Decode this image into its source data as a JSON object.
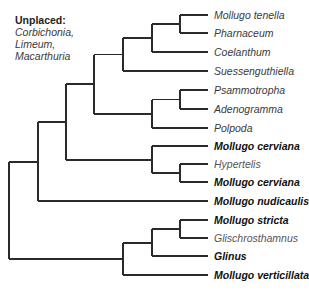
{
  "figure": {
    "type": "phylogenetic-tree",
    "orientation": "left-to-right",
    "branch_color": "#2a2a2a"
  },
  "unplaced": {
    "heading": "Unplaced:",
    "taxa": [
      "Corbichonia,",
      "Limeum,",
      "Macarthuria"
    ]
  },
  "leaves": [
    {
      "label": "Mollugo tenella",
      "bold": false,
      "y": 15
    },
    {
      "label": "Pharnaceum",
      "bold": false,
      "y": 33
    },
    {
      "label": "Coelanthum",
      "bold": false,
      "y": 52
    },
    {
      "label": "Suessenguthiella",
      "bold": false,
      "y": 71
    },
    {
      "label": "Psammotropha",
      "bold": false,
      "y": 90
    },
    {
      "label": "Adenogramma",
      "bold": false,
      "y": 109
    },
    {
      "label": "Polpoda",
      "bold": false,
      "y": 128
    },
    {
      "label": "Mollugo cerviana",
      "bold": true,
      "y": 146
    },
    {
      "label": "Hypertelis",
      "bold": false,
      "y": 164
    },
    {
      "label": "Mollugo cerviana",
      "bold": true,
      "y": 182
    },
    {
      "label": "Mollugo nudicaulis",
      "bold": true,
      "y": 201
    },
    {
      "label": "Mollugo stricta",
      "bold": true,
      "y": 220
    },
    {
      "label": "Glischrosthamnus",
      "bold": false,
      "y": 238
    },
    {
      "label": "Glinus",
      "bold": true,
      "y": 256
    },
    {
      "label": "Mollugo verticillata",
      "bold": true,
      "y": 275
    }
  ],
  "tree": {
    "leaf_x": 208,
    "nodes": [
      {
        "id": "root",
        "x": 9,
        "children_y": [
          162,
          259
        ]
      },
      {
        "id": "A",
        "x": 38,
        "children_y": [
          122,
          201
        ]
      },
      {
        "id": "B",
        "x": 66,
        "children_y": [
          84,
          160
        ]
      },
      {
        "id": "C",
        "x": 94,
        "children_y": [
          54.5,
          114
        ]
      },
      {
        "id": "D",
        "x": 123,
        "children_y": [
          38,
          71
        ]
      },
      {
        "id": "E",
        "x": 152,
        "children_y": [
          24,
          52
        ]
      },
      {
        "id": "F",
        "x": 180,
        "children_y": [
          15,
          33
        ]
      },
      {
        "id": "P",
        "x": 152,
        "children_y": [
          99.5,
          128
        ]
      },
      {
        "id": "Q",
        "x": 180,
        "children_y": [
          90,
          109
        ]
      },
      {
        "id": "M",
        "x": 152,
        "children_y": [
          146,
          173
        ]
      },
      {
        "id": "N",
        "x": 180,
        "children_y": [
          164,
          182
        ]
      },
      {
        "id": "L",
        "x": 123,
        "children_y": [
          243,
          275
        ]
      },
      {
        "id": "R",
        "x": 152,
        "children_y": [
          229,
          256
        ]
      },
      {
        "id": "S",
        "x": 180,
        "children_y": [
          220,
          238
        ]
      }
    ],
    "edges": [
      {
        "from_x": 9,
        "to_x": 38,
        "y": 162
      },
      {
        "from_x": 9,
        "to_x": 123,
        "y": 259
      },
      {
        "from_x": 38,
        "to_x": 66,
        "y": 122
      },
      {
        "from_x": 38,
        "to_x": 208,
        "y": 201
      },
      {
        "from_x": 66,
        "to_x": 94,
        "y": 84
      },
      {
        "from_x": 66,
        "to_x": 152,
        "y": 160
      },
      {
        "from_x": 94,
        "to_x": 123,
        "y": 54.5
      },
      {
        "from_x": 94,
        "to_x": 152,
        "y": 114
      },
      {
        "from_x": 123,
        "to_x": 152,
        "y": 38
      },
      {
        "from_x": 123,
        "to_x": 208,
        "y": 71
      },
      {
        "from_x": 152,
        "to_x": 180,
        "y": 24
      },
      {
        "from_x": 152,
        "to_x": 208,
        "y": 52
      },
      {
        "from_x": 180,
        "to_x": 208,
        "y": 15
      },
      {
        "from_x": 180,
        "to_x": 208,
        "y": 33
      },
      {
        "from_x": 152,
        "to_x": 180,
        "y": 99.5
      },
      {
        "from_x": 152,
        "to_x": 208,
        "y": 128
      },
      {
        "from_x": 180,
        "to_x": 208,
        "y": 90
      },
      {
        "from_x": 180,
        "to_x": 208,
        "y": 109
      },
      {
        "from_x": 152,
        "to_x": 208,
        "y": 146
      },
      {
        "from_x": 152,
        "to_x": 180,
        "y": 173
      },
      {
        "from_x": 180,
        "to_x": 208,
        "y": 164
      },
      {
        "from_x": 180,
        "to_x": 208,
        "y": 182
      },
      {
        "from_x": 123,
        "to_x": 152,
        "y": 243
      },
      {
        "from_x": 123,
        "to_x": 208,
        "y": 275
      },
      {
        "from_x": 152,
        "to_x": 180,
        "y": 229
      },
      {
        "from_x": 152,
        "to_x": 208,
        "y": 256
      },
      {
        "from_x": 180,
        "to_x": 208,
        "y": 220
      },
      {
        "from_x": 180,
        "to_x": 208,
        "y": 238
      }
    ]
  }
}
